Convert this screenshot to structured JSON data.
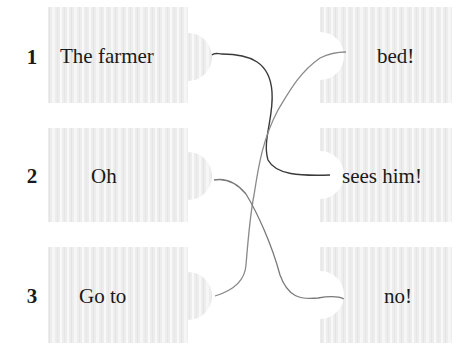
{
  "exercise": {
    "type": "match-sentence-halves",
    "left": [
      {
        "number": "1",
        "text": "The farmer"
      },
      {
        "number": "2",
        "text": "Oh"
      },
      {
        "number": "3",
        "text": "Go to"
      }
    ],
    "right": [
      {
        "text": "bed!"
      },
      {
        "text": "sees him!"
      },
      {
        "text": "no!"
      }
    ],
    "connections": [
      {
        "from": "1",
        "to": "sees him!",
        "color": "#3a3a3a"
      },
      {
        "from": "2",
        "to": "no!",
        "color": "#7a7a7a"
      },
      {
        "from": "3",
        "to": "bed!",
        "color": "#8a8a8a"
      }
    ]
  },
  "colors": {
    "piece_fill": "#ececec",
    "piece_stripe": "#f7f7f7",
    "text": "#1a1a1a"
  }
}
